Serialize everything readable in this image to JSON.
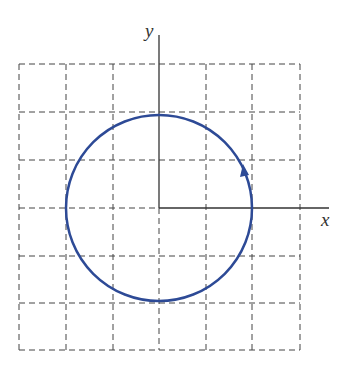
{
  "diagram": {
    "type": "circle-on-grid",
    "axes": {
      "x_label": "x",
      "y_label": "y"
    },
    "grid": {
      "cols": 6,
      "rows": 6,
      "cell_px": 47,
      "style": "dashed"
    },
    "circle": {
      "center": [
        0,
        0
      ],
      "radius_cells": 2,
      "direction": "counterclockwise",
      "color": "#2d4a96"
    },
    "axis_color": "#333333",
    "grid_color": "#444444"
  }
}
